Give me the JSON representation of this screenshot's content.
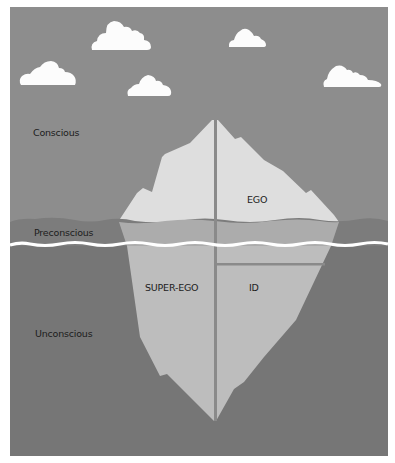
{
  "diagram": {
    "type": "iceberg-model",
    "layers": {
      "conscious": "Conscious",
      "preconscious": "Preconscious",
      "unconscious": "Unconscious"
    },
    "regions": {
      "ego": "EGO",
      "super_ego": "SUPER-EGO",
      "id": "ID"
    },
    "colors": {
      "sky": "#8d8d8d",
      "cloud": "#fcfcfc",
      "iceberg_above": "#dedede",
      "preconscious_band": "#7c7c7c",
      "iceberg_band": "#acacac",
      "waterline": "#ffffff",
      "deep_water": "#767676",
      "iceberg_below": "#bdbdbd",
      "divider": "#8a8a8a",
      "text": "#1c1c1c"
    },
    "clouds": 5
  }
}
